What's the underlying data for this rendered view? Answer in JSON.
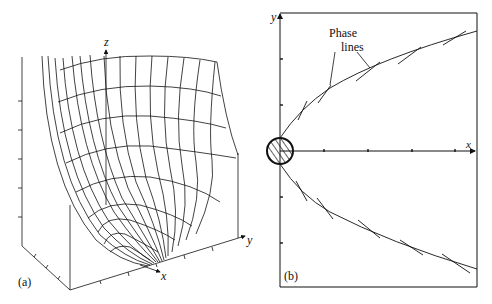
{
  "panel_a": {
    "label": "(a)",
    "axes": {
      "z": "z",
      "y": "y",
      "x": "x"
    }
  },
  "panel_b": {
    "label": "(b)",
    "axes": {
      "y": "y",
      "x": "x"
    },
    "annotation_line1": "Phase",
    "annotation_line2": "lines"
  },
  "colors": {
    "ink": "#111111",
    "background": "#ffffff"
  }
}
